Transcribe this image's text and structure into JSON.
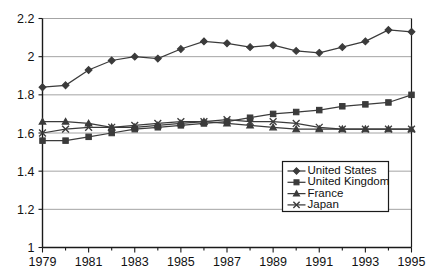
{
  "chart_data": {
    "type": "line",
    "title": "",
    "subtitle": "",
    "xlabel": "",
    "ylabel": "",
    "x": [
      1979,
      1980,
      1981,
      1982,
      1983,
      1984,
      1985,
      1986,
      1987,
      1988,
      1989,
      1990,
      1991,
      1992,
      1993,
      1994,
      1995
    ],
    "xlim": [
      1979,
      1995
    ],
    "ylim": [
      1,
      2.2
    ],
    "ytick_labels": [
      "1",
      "1.2",
      "1.4",
      "1.6",
      "1.8",
      "2",
      "2.2"
    ],
    "ytick_values": [
      1,
      1.2,
      1.4,
      1.6,
      1.8,
      2,
      2.2
    ],
    "xtick_labels": [
      "1979",
      "1981",
      "1983",
      "1985",
      "1987",
      "1989",
      "1991",
      "1993",
      "1995"
    ],
    "xtick_values": [
      1979,
      1981,
      1983,
      1985,
      1987,
      1989,
      1991,
      1993,
      1995
    ],
    "xminor_ticks": [
      1980,
      1982,
      1984,
      1986,
      1988,
      1990,
      1992,
      1994
    ],
    "grid": "horizontal",
    "legend_position": "bottom-right",
    "series": [
      {
        "name": "United States",
        "marker": "diamond",
        "color": "#3b3b3b",
        "values": [
          1.84,
          1.85,
          1.93,
          1.98,
          2.0,
          1.99,
          2.04,
          2.08,
          2.07,
          2.05,
          2.06,
          2.03,
          2.02,
          2.05,
          2.08,
          2.14,
          2.13
        ]
      },
      {
        "name": "United Kingdom",
        "marker": "square",
        "color": "#3b3b3b",
        "values": [
          1.56,
          1.56,
          1.58,
          1.6,
          1.62,
          1.63,
          1.64,
          1.65,
          1.66,
          1.68,
          1.7,
          1.71,
          1.72,
          1.74,
          1.75,
          1.76,
          1.8
        ]
      },
      {
        "name": "France",
        "marker": "triangle",
        "color": "#3b3b3b",
        "values": [
          1.66,
          1.66,
          1.65,
          1.63,
          1.63,
          1.64,
          1.65,
          1.66,
          1.65,
          1.64,
          1.63,
          1.62,
          1.62,
          1.62,
          1.62,
          1.62,
          1.62
        ]
      },
      {
        "name": "Japan",
        "marker": "x",
        "color": "#3b3b3b",
        "values": [
          1.6,
          1.62,
          1.63,
          1.63,
          1.64,
          1.65,
          1.66,
          1.66,
          1.67,
          1.66,
          1.66,
          1.65,
          1.63,
          1.62,
          1.62,
          1.62,
          1.62
        ]
      }
    ]
  },
  "legend": {
    "entries": [
      {
        "label": "United States",
        "marker": "diamond"
      },
      {
        "label": "United Kingdom",
        "marker": "square"
      },
      {
        "label": "France",
        "marker": "triangle"
      },
      {
        "label": "Japan",
        "marker": "x"
      }
    ]
  },
  "colors": {
    "series": "#3b3b3b",
    "gridline": "#9a9a9a",
    "axis": "#1a1a1a",
    "background": "#ffffff"
  }
}
